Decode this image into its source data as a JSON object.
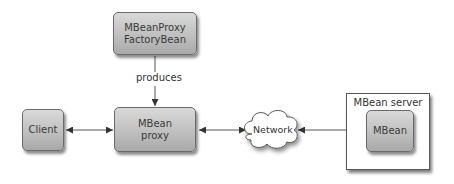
{
  "diagram": {
    "nodes": {
      "factory": {
        "line1": "MBeanProxy",
        "line2": "FactoryBean"
      },
      "proxy": {
        "line1": "MBean",
        "line2": "proxy"
      },
      "client": {
        "label": "Client"
      },
      "network": {
        "label": "Network"
      },
      "server": {
        "label": "MBean server"
      },
      "mbean": {
        "label": "MBean"
      }
    },
    "edges": [
      {
        "from": "factory",
        "to": "proxy",
        "label": "produces",
        "direction": "forward"
      },
      {
        "from": "client",
        "to": "proxy",
        "label": "",
        "direction": "both"
      },
      {
        "from": "proxy",
        "to": "network",
        "label": "",
        "direction": "both"
      },
      {
        "from": "network",
        "to": "mbean",
        "label": "",
        "direction": "both"
      }
    ],
    "colors": {
      "box_fill_top": "#d9d9d9",
      "box_fill_bottom": "#a9a9a9",
      "line": "#444444",
      "text": "#3a3a3a"
    }
  }
}
